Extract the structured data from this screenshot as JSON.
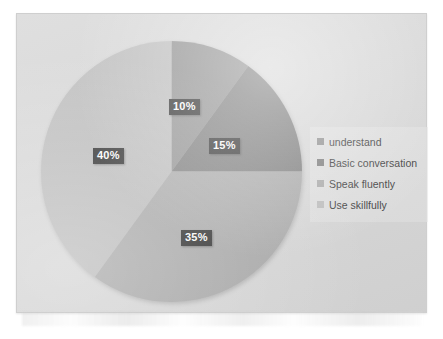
{
  "chart_data": {
    "type": "pie",
    "title": "",
    "categories": [
      "understand",
      "Basic conversation",
      "Speak fluently",
      "Use skillfully"
    ],
    "values": [
      10,
      15,
      35,
      40
    ],
    "value_labels": [
      "10%",
      "15%",
      "35%",
      "40%"
    ],
    "colors": [
      "#8f8f8f",
      "#7a7a7a",
      "#a9a9a9",
      "#bdbdbd"
    ],
    "units": "percent",
    "total": 100,
    "start_angle_deg": 0,
    "direction": "clockwise",
    "legend_position": "right",
    "grid": false,
    "xlabel": "",
    "ylabel": ""
  },
  "legend": {
    "items": [
      {
        "label": "understand",
        "color": "#8f8f8f"
      },
      {
        "label": "Basic conversation",
        "color": "#7a7a7a"
      },
      {
        "label": "Speak fluently",
        "color": "#a9a9a9"
      },
      {
        "label": "Use skillfully",
        "color": "#bdbdbd"
      }
    ]
  },
  "labels": {
    "slice_0": "10%",
    "slice_1": "15%",
    "slice_2": "35%",
    "slice_3": "40%"
  },
  "theme": {
    "plot_background": "#d8d8d8",
    "page_background": "#ffffff",
    "label_box": "#2b2b2b",
    "label_text": "#ffffff",
    "legend_text": "#3a3a3a"
  }
}
